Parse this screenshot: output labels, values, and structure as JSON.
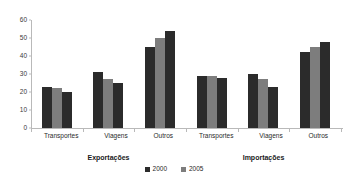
{
  "chart_data": {
    "type": "bar",
    "title": "",
    "xlabel": "",
    "ylabel": "",
    "ylim": [
      0,
      60
    ],
    "ytick_labels": [
      "0",
      "10",
      "20",
      "30",
      "40",
      "50",
      "60"
    ],
    "ytick_values": [
      0,
      10,
      20,
      30,
      40,
      50,
      60
    ],
    "grid": false,
    "legend_position": "bottom-center",
    "legend": [
      "2000",
      "2005"
    ],
    "groups": [
      {
        "name": "Exportações",
        "categories": [
          "Transportes",
          "Viagens",
          "Outros"
        ],
        "series": [
          {
            "name": "2000",
            "values": [
              23,
              31,
              45
            ]
          },
          {
            "name": "2005",
            "values": [
              22,
              27,
              50
            ]
          },
          {
            "name": "",
            "values": [
              20,
              25,
              54
            ]
          }
        ]
      },
      {
        "name": "Importações",
        "categories": [
          "Transportes",
          "Viagens",
          "Outros"
        ],
        "series": [
          {
            "name": "2000",
            "values": [
              29,
              30,
              42
            ]
          },
          {
            "name": "2005",
            "values": [
              29,
              27,
              45
            ]
          },
          {
            "name": "",
            "values": [
              28,
              23,
              48
            ]
          }
        ]
      }
    ],
    "colors": {
      "series_dark": "#2b2b2b",
      "series_light": "#7d7d7d",
      "axis": "#b9b9b9",
      "text": "#2a2a2a",
      "background": "#ffffff"
    }
  }
}
